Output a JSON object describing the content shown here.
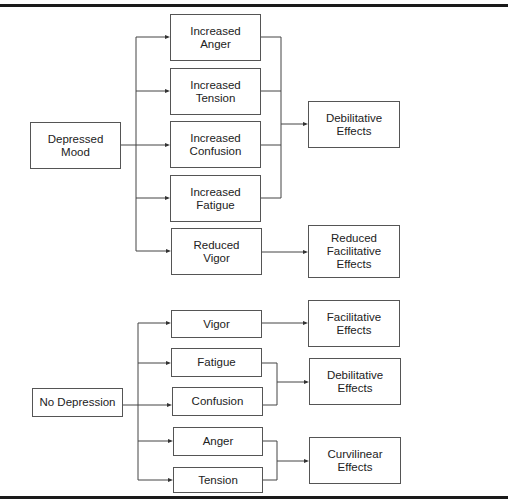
{
  "diagram": {
    "top": {
      "source": "Depressed\nMood",
      "mediators": [
        "Increased\nAnger",
        "Increased\nTension",
        "Increased\nConfusion",
        "Increased\nFatigue",
        "Reduced\nVigor"
      ],
      "outcomes": [
        "Debilitative\nEffects",
        "Reduced\nFacilitative\nEffects"
      ]
    },
    "bottom": {
      "source": "No Depression",
      "mediators": [
        "Vigor",
        "Fatigue",
        "Confusion",
        "Anger",
        "Tension"
      ],
      "outcomes": [
        "Facilitative\nEffects",
        "Debilitative\nEffects",
        "Curvilinear\nEffects"
      ]
    }
  }
}
